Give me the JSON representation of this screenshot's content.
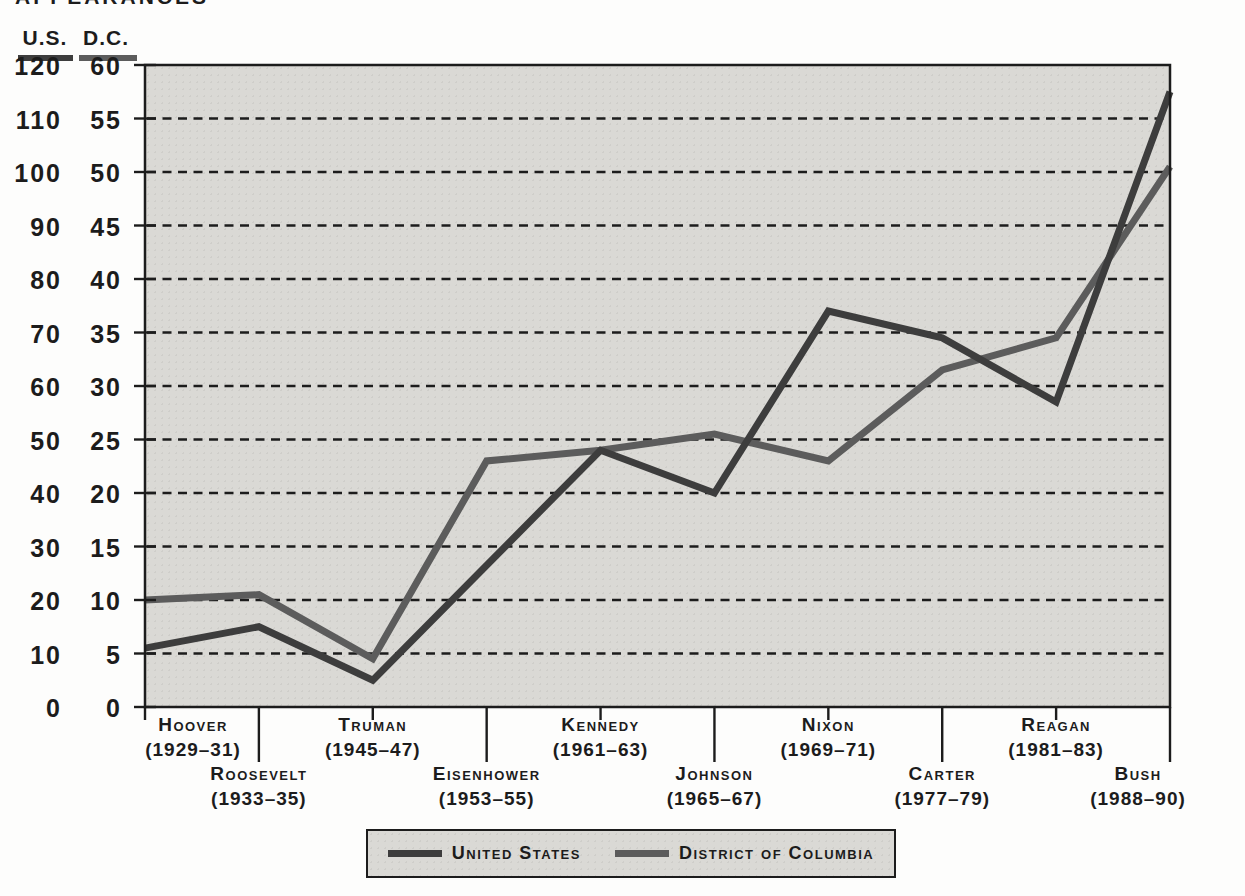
{
  "page_title_partial": "APPEARANCES",
  "y_axis": {
    "us_header": "U.S.",
    "dc_header": "D.C.",
    "us_ticks": [
      "120",
      "110",
      "100",
      "90",
      "80",
      "70",
      "60",
      "50",
      "40",
      "30",
      "20",
      "10",
      "0"
    ],
    "dc_ticks": [
      "60",
      "55",
      "50",
      "45",
      "40",
      "35",
      "30",
      "25",
      "20",
      "15",
      "10",
      "5",
      "0"
    ]
  },
  "x_axis": {
    "categories": [
      "Hoover",
      "Roosevelt",
      "Truman",
      "Eisenhower",
      "Kennedy",
      "Johnson",
      "Nixon",
      "Carter",
      "Reagan",
      "Bush"
    ],
    "years": [
      "(1929–31)",
      "(1933–35)",
      "(1945–47)",
      "(1953–55)",
      "(1961–63)",
      "(1965–67)",
      "(1969–71)",
      "(1977–79)",
      "(1981–83)",
      "(1988–90)"
    ]
  },
  "legend": {
    "us_label": "United States",
    "dc_label": "District of Columbia"
  },
  "colors": {
    "us_line": "#3d3d3d",
    "dc_line": "#5c5c5c",
    "ink": "#1c1c1c",
    "plot_bg": "#dad9d5"
  },
  "chart_data": {
    "type": "line",
    "title": "Appearances",
    "categories": [
      "Hoover (1929–31)",
      "Roosevelt (1933–35)",
      "Truman (1945–47)",
      "Eisenhower (1953–55)",
      "Kennedy (1961–63)",
      "Johnson (1965–67)",
      "Nixon (1969–71)",
      "Carter (1977–79)",
      "Reagan (1981–83)",
      "Bush (1988–90)"
    ],
    "series": [
      {
        "name": "United States",
        "axis": "U.S.",
        "axis_range": [
          0,
          120
        ],
        "axis_step": 10,
        "values": [
          11,
          15,
          5,
          26.5,
          48,
          40,
          74,
          69,
          57,
          115
        ]
      },
      {
        "name": "District of Columbia",
        "axis": "D.C.",
        "axis_range": [
          0,
          60
        ],
        "axis_step": 5,
        "values": [
          10,
          10.5,
          4.5,
          23,
          24,
          25.5,
          23,
          31.5,
          34.5,
          50.5
        ]
      }
    ],
    "grid": "horizontal-dashed",
    "gridline_values_dc_axis": [
      5,
      10,
      15,
      20,
      25,
      30,
      35,
      40,
      45,
      50,
      55
    ],
    "legend_position": "bottom"
  }
}
